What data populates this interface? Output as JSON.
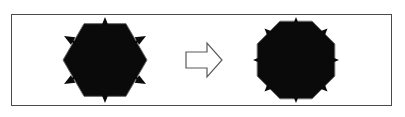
{
  "figure": {
    "background_color": "#ffffff",
    "frame": {
      "name": "outer-frame",
      "x": 11,
      "y": 14,
      "width": 381,
      "height": 92,
      "stroke_color": "#4a4a4a",
      "stroke_width": 1
    },
    "left_figure": {
      "label": "hexagon-with-six-fold-symmetry-axes",
      "shape": "hexagon",
      "sides": 6,
      "center_x": 105,
      "center_y": 60,
      "circumradius": 42,
      "rotation_deg": 0,
      "outline_color": "#6b6b6b",
      "axis_color": "#0a0a0a",
      "axis_count": 3,
      "arrow_tip_count": 6,
      "axis_length": 43,
      "axis_angles_deg": [
        90,
        30,
        150
      ]
    },
    "middle_arrow": {
      "label": "transformation-arrow",
      "direction": "right",
      "x": 186,
      "y": 43,
      "width": 36,
      "height": 34,
      "fill_color": "#ffffff",
      "stroke_color": "#5a5a5a"
    },
    "right_figure": {
      "label": "octagon-with-eight-fold-symmetry-axes",
      "shape": "octagon",
      "sides": 8,
      "center_x": 296,
      "center_y": 60,
      "circumradius": 42,
      "rotation_deg": 22.5,
      "outline_color": "#6b6b6b",
      "axis_color": "#0a0a0a",
      "axis_count": 4,
      "arrow_tip_count": 8,
      "axis_length": 43,
      "axis_angles_deg": [
        0,
        45,
        90,
        135
      ]
    }
  },
  "chart_data": {
    "type": "diagram",
    "series": [
      {
        "name": "hexagon-axes",
        "shape": "hexagon",
        "vertices": 6,
        "axis_directions_deg": [
          0,
          30,
          60,
          90,
          120,
          150,
          180,
          210,
          240,
          270,
          300,
          330
        ],
        "drawn_axis_angles_deg": [
          90,
          30,
          150
        ],
        "arrow_heads": 6
      },
      {
        "name": "octagon-axes",
        "shape": "octagon",
        "vertices": 8,
        "drawn_axis_angles_deg": [
          0,
          45,
          90,
          135
        ],
        "arrow_heads": 8
      }
    ],
    "annotations": [
      "right-pointing transformation arrow between the two figures"
    ],
    "xlabel": "",
    "ylabel": "",
    "grid": false,
    "legend": "none"
  }
}
